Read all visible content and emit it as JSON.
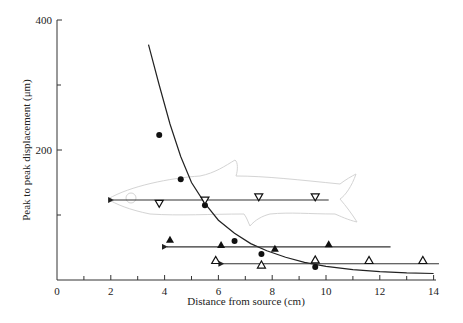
{
  "chart_data": {
    "type": "scatter",
    "title": "",
    "xlabel": "Distance from source (cm)",
    "ylabel": "Peak to peak displacement (μm)",
    "xlim": [
      0,
      14
    ],
    "ylim": [
      0,
      400
    ],
    "x_ticks": [
      0,
      2,
      4,
      6,
      8,
      10,
      12,
      14
    ],
    "x_minor_ticks": [
      1,
      3,
      5,
      7,
      9,
      11,
      13
    ],
    "y_ticks": [
      200,
      400
    ],
    "y_minor_ticks": [
      100,
      300
    ],
    "grid": false,
    "legend": null,
    "fit_curve": {
      "name": "decay curve",
      "points": [
        [
          3.4,
          362
        ],
        [
          3.8,
          300
        ],
        [
          4.2,
          240
        ],
        [
          4.6,
          190
        ],
        [
          5.0,
          150
        ],
        [
          5.5,
          118
        ],
        [
          6.0,
          92
        ],
        [
          6.6,
          72
        ],
        [
          7.2,
          56
        ],
        [
          7.8,
          45
        ],
        [
          8.5,
          35
        ],
        [
          9.2,
          27
        ],
        [
          10.0,
          21
        ],
        [
          11.0,
          16
        ],
        [
          12.0,
          13
        ],
        [
          13.0,
          11
        ],
        [
          14.0,
          10
        ]
      ]
    },
    "series": [
      {
        "name": "filled circles",
        "marker": "filled-circle",
        "points": [
          [
            3.8,
            223
          ],
          [
            4.6,
            155
          ],
          [
            5.5,
            115
          ],
          [
            6.6,
            60
          ],
          [
            7.6,
            40
          ],
          [
            9.6,
            20
          ]
        ]
      },
      {
        "name": "open down-triangles",
        "marker": "open-triangle-down",
        "points": [
          [
            3.8,
            118
          ],
          [
            5.5,
            123
          ],
          [
            7.5,
            128
          ],
          [
            9.6,
            128
          ]
        ],
        "arrow_line": {
          "y": 123,
          "x_from": 10.1,
          "x_to": 1.9
        }
      },
      {
        "name": "filled triangles",
        "marker": "filled-triangle-up",
        "points": [
          [
            4.2,
            62
          ],
          [
            6.1,
            54
          ],
          [
            8.1,
            48
          ],
          [
            10.1,
            55
          ]
        ],
        "arrow_line": {
          "y": 51,
          "x_from": 12.4,
          "x_to": 3.9
        }
      },
      {
        "name": "open up-triangles",
        "marker": "open-triangle-up",
        "points": [
          [
            5.9,
            30
          ],
          [
            7.6,
            23
          ],
          [
            9.6,
            31
          ],
          [
            11.6,
            30
          ],
          [
            13.6,
            30
          ]
        ],
        "arrow_line": {
          "y": 25,
          "x_from": 14.2,
          "x_to": 6.0
        }
      }
    ],
    "annotations": [
      "fish outline (faint) drawn behind data, head pointing left at ~1.9 cm"
    ]
  }
}
